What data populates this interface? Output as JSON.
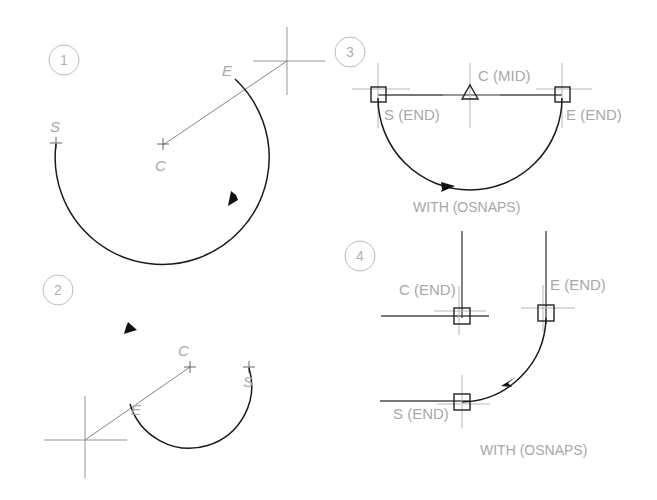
{
  "figure": {
    "background_color": "#ffffff",
    "arc_color": "#1a1a1a",
    "label_color": "#a8a8a8",
    "cursor_color": "#8a8a8a"
  },
  "panels": [
    {
      "number": "1",
      "labels": {
        "start": "S",
        "center": "C",
        "end": "E"
      },
      "caption": "",
      "markers": [
        {
          "name": "start-tick",
          "label": "S"
        },
        {
          "name": "center-cross",
          "label": "C"
        },
        {
          "name": "end-point",
          "label": "E"
        }
      ],
      "cursor": "crosshair",
      "arc_direction": "counterclockwise"
    },
    {
      "number": "2",
      "labels": {
        "start": "S",
        "center": "C",
        "end": "E"
      },
      "caption": "",
      "markers": [
        {
          "name": "start-tick",
          "label": "S"
        },
        {
          "name": "center-cross",
          "label": "C"
        },
        {
          "name": "end-point",
          "label": "E"
        }
      ],
      "cursor": "crosshair",
      "arc_direction": "counterclockwise"
    },
    {
      "number": "3",
      "labels": {
        "start": "S (END)",
        "center": "C (MID)",
        "end": "E (END)"
      },
      "caption": "WITH  (OSNAPS)",
      "markers": [
        {
          "name": "endpoint-snap-square",
          "label": "S (END)"
        },
        {
          "name": "midpoint-snap-triangle",
          "label": "C (MID)"
        },
        {
          "name": "endpoint-snap-square",
          "label": "E (END)"
        }
      ],
      "cursor": "snap-crosshair",
      "arc_direction": "clockwise-below-line"
    },
    {
      "number": "4",
      "labels": {
        "start": "S (END)",
        "center": "C (END)",
        "end": "E (END)"
      },
      "caption": "WITH  (OSNAPS)",
      "markers": [
        {
          "name": "endpoint-snap-square",
          "label": "C (END)"
        },
        {
          "name": "endpoint-snap-square",
          "label": "E (END)"
        },
        {
          "name": "endpoint-snap-square",
          "label": "S (END)"
        }
      ],
      "cursor": "snap-crosshair",
      "arc_direction": "counterclockwise"
    }
  ],
  "osnap_glyphs": {
    "endpoint": "square",
    "midpoint": "triangle"
  }
}
